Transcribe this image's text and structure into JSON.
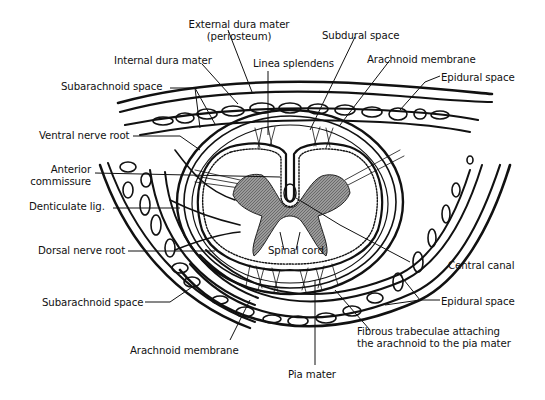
{
  "figure": {
    "colors": {
      "ink": "#111111",
      "gray_matter": "#8a8a8a",
      "background": "#ffffff"
    }
  },
  "labels": {
    "external_dura_1": "External dura mater",
    "external_dura_2": "(periosteum)",
    "subdural_space": "Subdural space",
    "internal_dura": "Internal dura mater",
    "linea_splendens": "Linea splendens",
    "arachnoid_membrane_top": "Arachnoid membrane",
    "subarachnoid_space_top": "Subarachnoid space",
    "epidural_space_top": "Epidural space",
    "ventral_nerve_root": "Ventral nerve root",
    "anterior_commissure_1": "Anterior",
    "anterior_commissure_2": "commissure",
    "denticulate_lig": "Denticulate lig.",
    "dorsal_nerve_root": "Dorsal nerve root",
    "spinal_cord": "Spinal cord",
    "central_canal": "Central canal",
    "subarachnoid_space_bottom": "Subarachnoid space",
    "epidural_space_bottom": "Epidural space",
    "fibrous_trabeculae_1": "Fibrous trabeculae attaching",
    "fibrous_trabeculae_2": "the arachnoid to the pia mater",
    "arachnoid_membrane_bottom": "Arachnoid membrane",
    "pia_mater": "Pia mater"
  }
}
